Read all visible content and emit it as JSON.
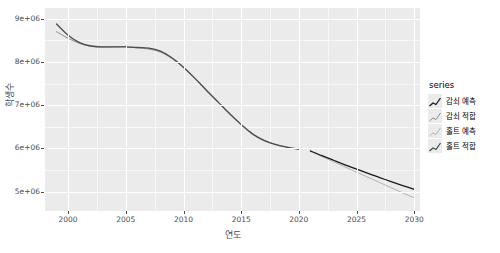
{
  "chart_data": {
    "type": "line",
    "title": "",
    "xlabel": "연도",
    "ylabel": "학생수",
    "xlim": [
      1998,
      2030.5
    ],
    "ylim": [
      4550000,
      9250000
    ],
    "xticks": [
      "2000",
      "2005",
      "2010",
      "2015",
      "2020",
      "2025",
      "2030"
    ],
    "xtick_values": [
      2000,
      2005,
      2010,
      2015,
      2020,
      2025,
      2030
    ],
    "yticks": [
      "5e+06",
      "6e+06",
      "7e+06",
      "8e+06",
      "9e+06"
    ],
    "ytick_values": [
      5000000,
      6000000,
      7000000,
      8000000,
      9000000
    ],
    "grid": true,
    "legend_position": "right",
    "legend_title": "series",
    "series": [
      {
        "name": "감쇠 예측",
        "color": "#1a1a1a",
        "width": 1.3,
        "points": [
          [
            2021,
            5940000
          ],
          [
            2022,
            5830000
          ],
          [
            2023,
            5725000
          ],
          [
            2024,
            5620000
          ],
          [
            2025,
            5520000
          ],
          [
            2026,
            5420000
          ],
          [
            2027,
            5325000
          ],
          [
            2028,
            5230000
          ],
          [
            2029,
            5140000
          ],
          [
            2030,
            5050000
          ]
        ]
      },
      {
        "name": "감쇠 적합",
        "color": "#8c8c8c",
        "width": 1.0,
        "points": [
          [
            1999,
            8700000
          ],
          [
            2000,
            8550000
          ],
          [
            2001,
            8430000
          ],
          [
            2002,
            8360000
          ],
          [
            2003,
            8345000
          ],
          [
            2004,
            8350000
          ],
          [
            2005,
            8355000
          ],
          [
            2006,
            8330000
          ],
          [
            2007,
            8300000
          ],
          [
            2008,
            8230000
          ],
          [
            2009,
            8080000
          ],
          [
            2010,
            7870000
          ],
          [
            2011,
            7620000
          ],
          [
            2012,
            7350000
          ],
          [
            2013,
            7080000
          ],
          [
            2014,
            6810000
          ],
          [
            2015,
            6560000
          ],
          [
            2016,
            6340000
          ],
          [
            2017,
            6190000
          ],
          [
            2018,
            6090000
          ],
          [
            2019,
            6030000
          ],
          [
            2020,
            5985000
          ]
        ]
      },
      {
        "name": "홀트 예측",
        "color": "#b3b3b3",
        "width": 1.0,
        "points": [
          [
            2021,
            5930000
          ],
          [
            2022,
            5810000
          ],
          [
            2023,
            5690000
          ],
          [
            2024,
            5570000
          ],
          [
            2025,
            5450000
          ],
          [
            2026,
            5330000
          ],
          [
            2027,
            5210000
          ],
          [
            2028,
            5090000
          ],
          [
            2029,
            4970000
          ],
          [
            2030,
            4855000
          ]
        ]
      },
      {
        "name": "홀트 적합",
        "color": "#4d4d4d",
        "width": 1.3,
        "points": [
          [
            1999,
            8880000
          ],
          [
            2000,
            8620000
          ],
          [
            2001,
            8450000
          ],
          [
            2002,
            8370000
          ],
          [
            2003,
            8350000
          ],
          [
            2004,
            8350000
          ],
          [
            2005,
            8350000
          ],
          [
            2006,
            8335000
          ],
          [
            2007,
            8320000
          ],
          [
            2008,
            8250000
          ],
          [
            2009,
            8100000
          ],
          [
            2010,
            7880000
          ],
          [
            2011,
            7620000
          ],
          [
            2012,
            7340000
          ],
          [
            2013,
            7070000
          ],
          [
            2014,
            6800000
          ],
          [
            2015,
            6550000
          ],
          [
            2016,
            6330000
          ],
          [
            2017,
            6180000
          ],
          [
            2018,
            6085000
          ],
          [
            2019,
            6025000
          ],
          [
            2020,
            5980000
          ]
        ]
      }
    ]
  }
}
